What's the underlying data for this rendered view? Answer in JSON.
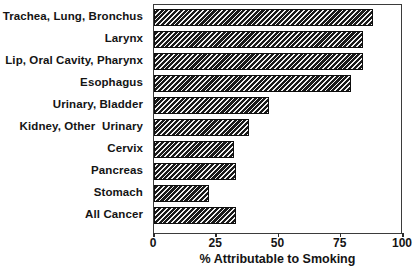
{
  "chart_data": {
    "type": "bar",
    "orientation": "horizontal",
    "title": "",
    "xlabel": "% Attributable to Smoking",
    "ylabel": "",
    "xlim": [
      0,
      100
    ],
    "xticks": [
      0,
      25,
      50,
      75,
      100
    ],
    "xticklabels": [
      "0",
      "25",
      "50",
      "75",
      "100"
    ],
    "grid": false,
    "legend": null,
    "categories": [
      "Trachea, Lung, Bronchus",
      "Larynx",
      "Lip, Oral Cavity, Pharynx",
      "Esophagus",
      "Urinary, Bladder",
      "Kidney, Other  Urinary",
      "Cervix",
      "Pancreas",
      "Stomach",
      "All Cancer"
    ],
    "values": [
      88,
      84,
      84,
      79,
      46,
      38,
      32,
      33,
      22,
      33
    ],
    "bar_fill": "hatched-diagonal",
    "bar_color": "#1a1a1a",
    "axis_color": "#3b3b3b"
  }
}
